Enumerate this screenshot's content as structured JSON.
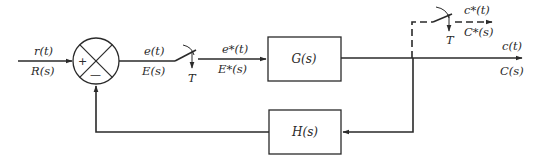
{
  "diagram": {
    "type": "sampled-data closed-loop control block diagram",
    "colors": {
      "line": "#2a2a2a",
      "background": "#ffffff"
    },
    "input": {
      "time": "r(t)",
      "laplace": "R(s)"
    },
    "summing_junction": {
      "plus": "+",
      "minus": "—"
    },
    "error": {
      "time": "e(t)",
      "laplace": "E(s)"
    },
    "sampler1": {
      "period": "T"
    },
    "sampled_error": {
      "time": "e*(t)",
      "laplace": "E*(s)"
    },
    "forward_block": {
      "label": "G(s)"
    },
    "output": {
      "time": "c(t)",
      "laplace": "C(s)"
    },
    "sampler2": {
      "period": "T"
    },
    "sampled_output": {
      "time": "c*(t)",
      "laplace": "C*(s)"
    },
    "feedback_block": {
      "label": "H(s)"
    }
  }
}
